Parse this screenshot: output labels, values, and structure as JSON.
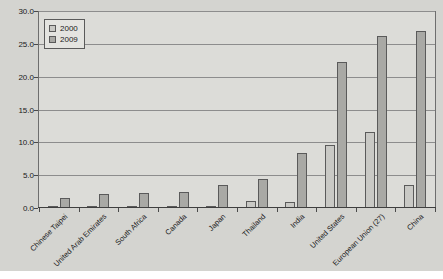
{
  "chart_data": {
    "type": "bar",
    "title": "",
    "xlabel": "",
    "ylabel": "",
    "ylim": [
      0,
      30
    ],
    "yticks": [
      "0.0",
      "5.0",
      "10.0",
      "15.0",
      "20.0",
      "25.0",
      "30.0"
    ],
    "ytick_values": [
      0,
      5,
      10,
      15,
      20,
      25,
      30
    ],
    "grid": true,
    "legend_position": "top-left",
    "categories": [
      "Chinese Taipei",
      "United Arab Emirates",
      "South Africa",
      "Canada",
      "Japan",
      "Thailand",
      "India",
      "United States",
      "European Union (27)",
      "China"
    ],
    "series": [
      {
        "name": "2000",
        "color": "#c9c9c5",
        "values": [
          0.1,
          0.0,
          0.1,
          0.2,
          0.1,
          1.1,
          0.9,
          9.7,
          11.7,
          3.6
        ]
      },
      {
        "name": "2009",
        "color": "#a9a9a5",
        "values": [
          1.6,
          2.1,
          2.3,
          2.5,
          3.5,
          4.5,
          8.4,
          22.5,
          26.5,
          27.3
        ]
      }
    ]
  },
  "legend": {
    "items": [
      {
        "label": "2000"
      },
      {
        "label": "2009"
      }
    ]
  }
}
